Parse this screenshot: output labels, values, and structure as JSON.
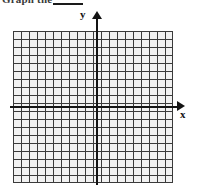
{
  "page": {
    "width": 199,
    "height": 195,
    "background": "#ffffff"
  },
  "prompt": {
    "text": "Graph the",
    "answer_blank_label": ""
  },
  "chart_data": {
    "type": "grid",
    "title": "",
    "xlabel": "x",
    "ylabel": "y",
    "grid": true,
    "grid_columns": 20,
    "grid_rows": 19,
    "cell_size_px": 8,
    "xlim": [
      -10,
      10
    ],
    "ylim": [
      -9,
      10
    ],
    "origin_cell": {
      "col": 10,
      "row": 9
    },
    "x_axis_arrow": "right",
    "y_axis_arrow": "up",
    "tick_labels_x": [],
    "tick_labels_y": [],
    "series": [],
    "axis_color": "#141414",
    "gridline_color": "#3b3b3b",
    "cell_fill_color": "#f2f2f2"
  }
}
